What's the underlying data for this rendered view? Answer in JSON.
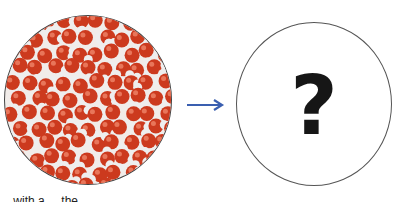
{
  "diagram": {
    "left_panel": {
      "label": "water-molecules-image",
      "molecule_color": "#cc3a1e",
      "hydrogen_color": "#eeeeee"
    },
    "arrow": {
      "color": "#3a5fb0"
    },
    "right_panel": {
      "symbol": "?"
    },
    "caption": "... with a ... the ..."
  }
}
